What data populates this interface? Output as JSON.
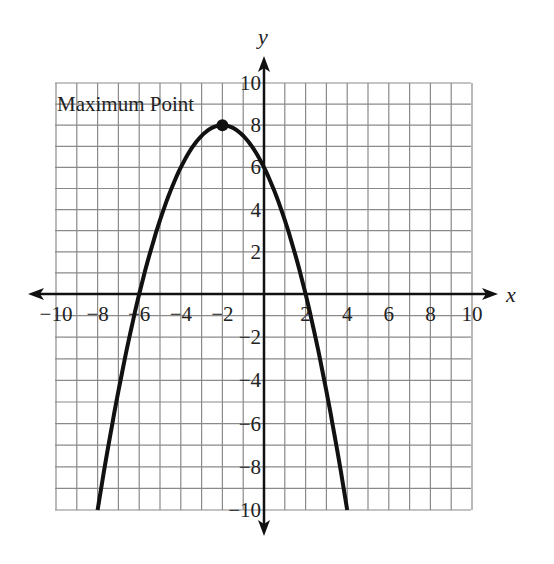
{
  "chart_data": {
    "type": "line",
    "title": "",
    "xlabel": "x",
    "ylabel": "y",
    "xlim": [
      -10,
      10
    ],
    "ylim": [
      -10,
      10
    ],
    "grid": true,
    "grid_step": 1,
    "x_tick_labels": [
      "−10",
      "−8",
      "−6",
      "−4",
      "−2",
      "2",
      "4",
      "6",
      "8",
      "10"
    ],
    "x_ticks": [
      -10,
      -8,
      -6,
      -4,
      -2,
      2,
      4,
      6,
      8,
      10
    ],
    "y_tick_labels": [
      "10",
      "8",
      "6",
      "4",
      "2",
      "−2",
      "−4",
      "−6",
      "−8",
      "−10"
    ],
    "y_ticks": [
      10,
      8,
      6,
      4,
      2,
      -2,
      -4,
      -6,
      -8,
      -10
    ],
    "series": [
      {
        "name": "parabola",
        "equation": "y = -0.5(x + 2)^2 + 8",
        "x": [
          -8,
          -7,
          -6,
          -5,
          -4,
          -3,
          -2,
          -1,
          0,
          1,
          2,
          3,
          4
        ],
        "y": [
          -10,
          -4.5,
          0,
          3.5,
          6,
          7.5,
          8,
          7.5,
          6,
          3.5,
          0,
          -4.5,
          -10
        ]
      }
    ],
    "annotations": [
      {
        "text": "Maximum Point",
        "x": -2,
        "y": 8,
        "marker": "filled-circle"
      }
    ],
    "legend": null
  },
  "labels": {
    "x_axis": "x",
    "y_axis": "y",
    "max_point": "Maximum Point"
  },
  "colors": {
    "grid": "#8a8a8a",
    "axis": "#111111",
    "curve": "#111111",
    "background": "#ffffff"
  }
}
